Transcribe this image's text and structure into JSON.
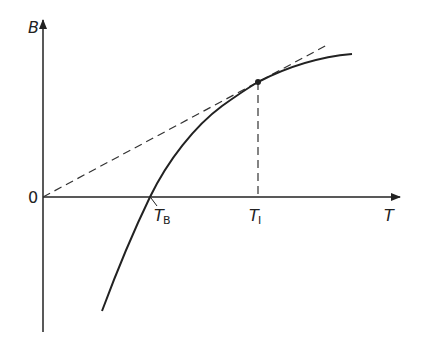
{
  "diagram": {
    "type": "graph",
    "y_axis_label": "B",
    "x_axis_label": "T",
    "origin_label": "0",
    "boyle_label": {
      "main": "T",
      "sub": "B"
    },
    "inversion_label": {
      "main": "T",
      "sub": "I"
    },
    "curve": "solid curve B(T) crossing zero at T_B, increasing and concave",
    "tangent": "dashed line from origin tangent to the curve at T_I",
    "drop_line": "dashed vertical line from tangent point down to T_I",
    "colors": {
      "ink": "#222222",
      "background": "#ffffff"
    }
  }
}
